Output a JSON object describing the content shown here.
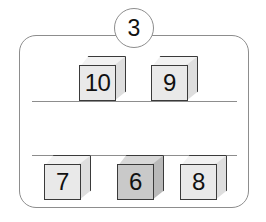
{
  "badge": {
    "label": "3",
    "name": "problem-number"
  },
  "panel": {
    "border_color": "#8d8d8d",
    "background_color": "#ffffff"
  },
  "shelves": [
    {
      "name": "upper-shelf-line"
    },
    {
      "name": "lower-shelf-line"
    }
  ],
  "colors": {
    "outline": "#3a3a3a",
    "cube_light": "#e9e9e9",
    "cube_dark": "#c9c9c9",
    "text": "#111111"
  },
  "rows": {
    "top": {
      "cubes": [
        {
          "label": "10",
          "shade": "light"
        },
        {
          "label": "9",
          "shade": "light"
        }
      ]
    },
    "bottom": {
      "cubes": [
        {
          "label": "7",
          "shade": "light"
        },
        {
          "label": "6",
          "shade": "dark"
        },
        {
          "label": "8",
          "shade": "light"
        }
      ]
    }
  }
}
